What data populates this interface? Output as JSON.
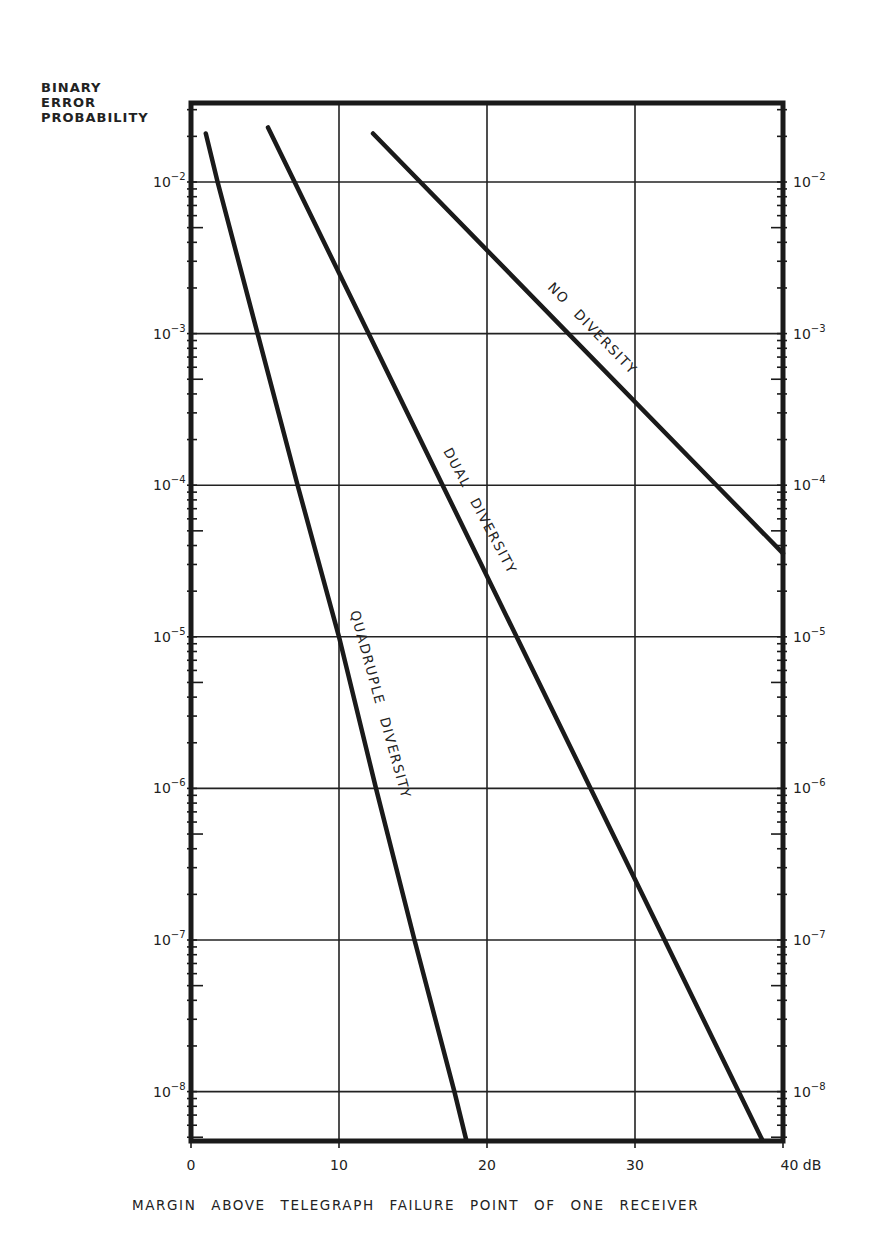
{
  "chart_data": {
    "type": "line",
    "title": "",
    "ylabel_lines": [
      "BINARY",
      "ERROR",
      "PROBABILITY"
    ],
    "xlabel": "MARGIN  ABOVE  TELEGRAPH FAILURE  POINT OF ONE  RECEIVER",
    "x_unit": "dB",
    "xlim": [
      0,
      40
    ],
    "x_ticks": [
      0,
      10,
      20,
      30,
      40
    ],
    "x_tick_labels": [
      "0",
      "10",
      "20",
      "30",
      "40 dB"
    ],
    "y_scale": "log",
    "ylim": [
      4.8e-09,
      0.033
    ],
    "y_ticks_exponents": [
      -2,
      -3,
      -4,
      -5,
      -6,
      -7,
      -8
    ],
    "y_tick_labels": [
      "10^-2",
      "10^-3",
      "10^-4",
      "10^-5",
      "10^-6",
      "10^-7",
      "10^-8"
    ],
    "right_axis_labels": [
      "10^-2",
      "10^-3",
      "10^-4",
      "10^-5",
      "10^-6",
      "10^-7",
      "10^-8"
    ],
    "grid": true,
    "legend": "inline labels along curves",
    "series": [
      {
        "name": "NO DIVERSITY",
        "x": [
          12.3,
          25.5,
          35.5,
          40
        ],
        "log10_y": [
          -1.68,
          -3.0,
          -4.0,
          -4.45
        ],
        "y": [
          0.021,
          0.001,
          0.0001,
          3.5e-05
        ]
      },
      {
        "name": "DUAL DIVERSITY",
        "x": [
          5.2,
          7.0,
          12.0,
          17.0,
          22.0,
          27.0,
          32.0,
          37.0,
          38.6
        ],
        "log10_y": [
          -1.64,
          -2.0,
          -3.0,
          -4.0,
          -5.0,
          -6.0,
          -7.0,
          -8.0,
          -8.32
        ],
        "y": [
          0.023,
          0.01,
          0.001,
          0.0001,
          1e-05,
          1e-06,
          1e-07,
          1e-08,
          4.8e-09
        ]
      },
      {
        "name": "QUADRUPLE DIVERSITY",
        "x": [
          1.0,
          1.8,
          4.5,
          7.2,
          10.0,
          12.5,
          15.1,
          17.8,
          18.6
        ],
        "log10_y": [
          -1.68,
          -2.0,
          -3.0,
          -4.0,
          -5.0,
          -6.0,
          -7.0,
          -8.0,
          -8.32
        ],
        "y": [
          0.021,
          0.01,
          0.001,
          0.0001,
          1e-05,
          1e-06,
          1e-07,
          1e-08,
          4.8e-09
        ]
      }
    ]
  }
}
